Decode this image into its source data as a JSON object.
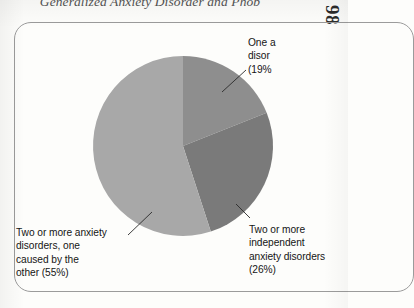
{
  "page": {
    "running_head": "Generalized Anxiety Disorder and Phob",
    "folio": "98"
  },
  "figure": {
    "frame": "rounded-rectangle"
  },
  "chart_data": {
    "type": "pie",
    "title": "",
    "xlabel": "",
    "ylabel": "",
    "legend_position": "callout-labels",
    "grid": false,
    "start_angle_deg": 0,
    "direction": "clockwise",
    "categories": [
      "One anxiety disorder",
      "Two or more independent anxiety disorders",
      "Two or more anxiety disorders, one caused by the other"
    ],
    "values": [
      19,
      26,
      55
    ],
    "value_unit": "%",
    "colors": [
      "#8e8e8e",
      "#7a7a7a",
      "#a8a8a8"
    ],
    "slices": [
      {
        "label": "One anxiety disorder",
        "value": 19,
        "color": "#8e8e8e"
      },
      {
        "label": "Two or more independent anxiety disorders",
        "value": 26,
        "color": "#7a7a7a"
      },
      {
        "label": "Two or more anxiety disorders, one caused by the other",
        "value": 55,
        "color": "#a8a8a8"
      }
    ]
  },
  "labels": {
    "one_anxiety": {
      "line1": "One a",
      "line2": "disor",
      "line3": "(19%",
      "full": "One anxiety disorder (19%)"
    },
    "two_caused": {
      "line1": "Two or more anxiety",
      "line2": "disorders, one",
      "line3": "caused by the",
      "line4": "other (55%)",
      "full": "Two or more anxiety disorders, one caused by the other (55%)"
    },
    "two_independent": {
      "line1": "Two or more",
      "line2": "independent",
      "line3": "anxiety disorders",
      "line4": "(26%)",
      "full": "Two or more independent anxiety disorders (26%)"
    }
  }
}
